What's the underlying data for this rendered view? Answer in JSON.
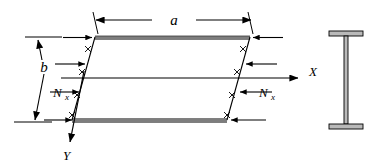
{
  "figure": {
    "background_color": "#ffffff",
    "line_color": "#000000",
    "edge_band_color": "#6b6b6b"
  },
  "labels": {
    "dimension_a": "a",
    "dimension_b": "b",
    "axis_x": "X",
    "axis_y": "Y",
    "load_left": "N",
    "load_left_sub": "x",
    "load_right": "N",
    "load_right_sub": "x"
  },
  "plate": {
    "description": "skewed parallelogram plate in oblique projection",
    "top_edge_y": 37,
    "bottom_edge_y": 120,
    "left_top_x": 95,
    "left_bottom_x": 72,
    "right_top_x": 250,
    "right_bottom_x": 227,
    "centerline_label": "x-axis centerline"
  },
  "loads": {
    "left_arrow_count": 4,
    "right_arrow_count": 4,
    "left_direction": "pointing-right-inward",
    "right_direction": "pointing-left-inward",
    "hatch_marks": "X-shaped tick marks along loaded edges"
  },
  "cross_section": {
    "name": "I-beam cross section",
    "flange_width": 34,
    "web_thickness": 4,
    "height": 98
  }
}
